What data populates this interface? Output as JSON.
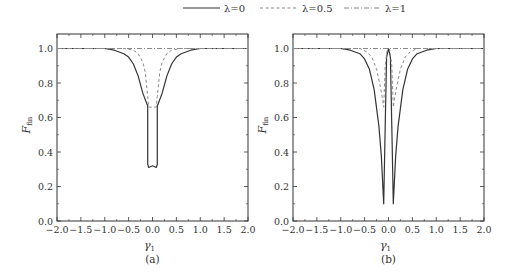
{
  "legend": {
    "items": [
      {
        "label": "λ=0",
        "style": "solid"
      },
      {
        "label": "λ=0.5",
        "style": "dashed"
      },
      {
        "label": "λ=1",
        "style": "dashdot"
      }
    ]
  },
  "chart_data": [
    {
      "type": "line",
      "title": "",
      "caption": "(a)",
      "xlabel": "γ",
      "xlabel_sub": "1",
      "ylabel": "F",
      "ylabel_sub": "fin",
      "xlim": [
        -2.0,
        2.0
      ],
      "ylim": [
        0.0,
        1.08
      ],
      "xticks": [
        "−2.0",
        "−1.5",
        "−1.0",
        "−0.5",
        "0.0",
        "0.5",
        "1.0",
        "1.5",
        "2.0"
      ],
      "yticks": [
        "0.0",
        "0.2",
        "0.4",
        "0.6",
        "0.8",
        "1.0"
      ],
      "grid": false,
      "legend_position": "top-center (shared)",
      "series": [
        {
          "name": "λ=0",
          "style": "solid",
          "x": [
            -2.0,
            -1.0,
            -0.8,
            -0.6,
            -0.5,
            -0.4,
            -0.3,
            -0.2,
            -0.12,
            -0.1,
            -0.1,
            -0.08,
            0.0,
            0.08,
            0.1,
            0.1,
            0.12,
            0.2,
            0.3,
            0.4,
            0.5,
            0.6,
            0.8,
            1.0,
            2.0
          ],
          "y": [
            1.0,
            1.0,
            0.99,
            0.97,
            0.95,
            0.91,
            0.84,
            0.74,
            0.68,
            0.67,
            0.33,
            0.31,
            0.32,
            0.31,
            0.33,
            0.67,
            0.68,
            0.74,
            0.84,
            0.91,
            0.95,
            0.97,
            0.99,
            1.0,
            1.0
          ]
        },
        {
          "name": "λ=0.5",
          "style": "dashed",
          "x": [
            -2.0,
            -0.6,
            -0.4,
            -0.3,
            -0.2,
            -0.15,
            -0.1,
            -0.08,
            0.0,
            0.08,
            0.1,
            0.15,
            0.2,
            0.3,
            0.4,
            0.6,
            2.0
          ],
          "y": [
            1.0,
            1.0,
            0.99,
            0.97,
            0.92,
            0.86,
            0.72,
            0.66,
            0.66,
            0.66,
            0.72,
            0.86,
            0.92,
            0.97,
            0.99,
            1.0,
            1.0
          ]
        },
        {
          "name": "λ=1",
          "style": "dashdot",
          "x": [
            -2.0,
            2.0
          ],
          "y": [
            1.0,
            1.0
          ]
        }
      ]
    },
    {
      "type": "line",
      "title": "",
      "caption": "(b)",
      "xlabel": "γ",
      "xlabel_sub": "1",
      "ylabel": "F",
      "ylabel_sub": "fin",
      "xlim": [
        -2.0,
        2.0
      ],
      "ylim": [
        0.0,
        1.08
      ],
      "xticks": [
        "−2.0",
        "−1.5",
        "−1.0",
        "−0.5",
        "0.0",
        "0.5",
        "1.0",
        "1.5",
        "2.0"
      ],
      "yticks": [
        "0.0",
        "0.2",
        "0.4",
        "0.6",
        "0.8",
        "1.0"
      ],
      "grid": false,
      "legend_position": "top-center (shared)",
      "series": [
        {
          "name": "λ=0",
          "style": "solid",
          "x": [
            -2.0,
            -1.0,
            -0.8,
            -0.6,
            -0.5,
            -0.4,
            -0.3,
            -0.2,
            -0.15,
            -0.1,
            -0.07,
            -0.04,
            0.0,
            0.04,
            0.07,
            0.1,
            0.15,
            0.2,
            0.3,
            0.4,
            0.5,
            0.6,
            0.8,
            1.0,
            2.0
          ],
          "y": [
            1.0,
            1.0,
            0.99,
            0.97,
            0.94,
            0.88,
            0.76,
            0.55,
            0.38,
            0.1,
            0.55,
            0.95,
            1.0,
            0.95,
            0.55,
            0.1,
            0.38,
            0.55,
            0.76,
            0.88,
            0.94,
            0.97,
            0.99,
            1.0,
            1.0
          ]
        },
        {
          "name": "λ=0.5",
          "style": "dashed",
          "x": [
            -2.0,
            -0.6,
            -0.45,
            -0.35,
            -0.25,
            -0.18,
            -0.12,
            -0.1,
            -0.07,
            -0.03,
            0.0,
            0.03,
            0.07,
            0.1,
            0.12,
            0.18,
            0.25,
            0.35,
            0.45,
            0.6,
            2.0
          ],
          "y": [
            1.0,
            1.0,
            0.98,
            0.95,
            0.88,
            0.79,
            0.7,
            0.66,
            0.9,
            0.99,
            1.0,
            0.99,
            0.9,
            0.66,
            0.7,
            0.79,
            0.88,
            0.95,
            0.98,
            1.0,
            1.0
          ]
        },
        {
          "name": "λ=1",
          "style": "dashdot",
          "x": [
            -2.0,
            2.0
          ],
          "y": [
            1.0,
            1.0
          ]
        }
      ]
    }
  ]
}
